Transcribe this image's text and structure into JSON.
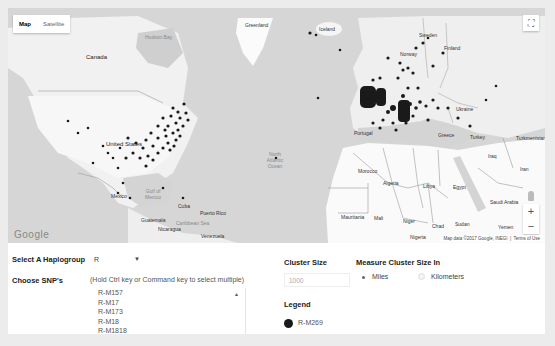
{
  "map": {
    "type_control": {
      "map_label": "Map",
      "satellite_label": "Satellite",
      "selected": "Map"
    },
    "fullscreen_icon": "fullscreen-icon",
    "zoom": {
      "in_label": "+",
      "out_label": "−"
    },
    "google_logo": "Google",
    "attribution": "Map data ©2017 Google, INEGI",
    "terms_label": "Terms of Use",
    "labels": {
      "canada": "Canada",
      "hudson_bay": "Hudson Bay",
      "greenland": "Greenland",
      "iceland": "Iceland",
      "united_states": "United States",
      "mexico": "Mexico",
      "gulf_of_mexico": "Gulf of Mexico",
      "cuba": "Cuba",
      "puerto_rico": "Puerto Rico",
      "caribbean_sea": "Caribbean Sea",
      "guatemala": "Guatemala",
      "nicaragua": "Nicaragua",
      "venezuela": "Venezuela",
      "north_atlantic_ocean": "North Atlantic Ocean",
      "sweden": "Sweden",
      "finland": "Finland",
      "norway": "Norway",
      "ukraine": "Ukraine",
      "portugal": "Portugal",
      "greece": "Greece",
      "turkey": "Turkey",
      "turkmenistan": "Turkmenistan",
      "iraq": "Iraq",
      "iran": "Iran",
      "syria": "Syria",
      "morocco": "Morocco",
      "algeria": "Algeria",
      "libya": "Libya",
      "egypt": "Egypt",
      "saudi_arabia": "Saudi Arabia",
      "western_sahara": "Western Sahara",
      "mauritania": "Mauritania",
      "mali": "Mali",
      "niger": "Niger",
      "chad": "Chad",
      "sudan": "Sudan",
      "yemen": "Yemen",
      "oman": "Oman",
      "burkina_faso": "Burkina Faso",
      "nigeria": "Nigeria",
      "ghana": "Ghana",
      "senegal": "Senegal"
    },
    "marker_color": "#1a1a1a"
  },
  "controls": {
    "haplogroup": {
      "label": "Select A Haplogroup",
      "value": "R"
    },
    "snps": {
      "label": "Choose SNP's",
      "hint": "(Hold Ctrl key or Command key to select multiple)",
      "options": [
        "R-M157",
        "R-M17",
        "R-M173",
        "R-M18",
        "R-M1818"
      ]
    },
    "cluster_size": {
      "label": "Cluster Size",
      "placeholder": "1000"
    },
    "measure": {
      "label": "Measure Cluster Size In",
      "options": [
        {
          "label": "Miles",
          "selected": true
        },
        {
          "label": "Kilometers",
          "selected": false
        }
      ]
    },
    "legend": {
      "title": "Legend",
      "items": [
        {
          "label": "R-M269",
          "color": "#1a1a1a"
        }
      ]
    }
  }
}
